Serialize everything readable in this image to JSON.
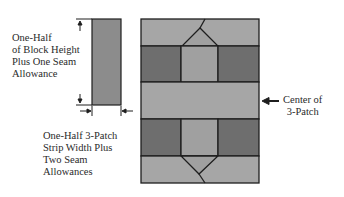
{
  "labels": {
    "height_note": "One-Half\nof Block Height\nPlus One Seam\nAllowance",
    "width_note": "One-Half 3-Patch\nStrip Width Plus\nTwo Seam\nAllowances",
    "center_note": "Center of\n3-Patch"
  },
  "colors": {
    "light_fabric": "#a6a6a6",
    "dark_fabric": "#6e6e6e",
    "medium_fabric": "#9a9a9a",
    "strip_fabric": "#8c8c8c",
    "outline": "#1e1e1e"
  }
}
